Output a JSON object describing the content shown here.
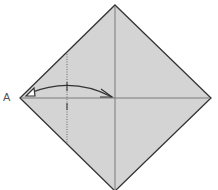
{
  "diagram": {
    "type": "origami-fold-step",
    "paper_color": "#d4d4d4",
    "edge_color": "#333333",
    "crease_color": "#7a7a7a",
    "arrow_color": "#333333",
    "vertex_label": "A",
    "instruction": "Fold corner A to the center point along the dotted valley-fold line",
    "shape": "square-rotated-45",
    "vertices": {
      "top": [
        115,
        5
      ],
      "right": [
        211,
        98
      ],
      "bottom": [
        115,
        191
      ],
      "left": [
        20,
        98
      ]
    },
    "creases": [
      "vertical-center",
      "horizontal-center"
    ],
    "fold_line": {
      "style": "dotted",
      "x": 67,
      "y_start": 54,
      "y_end": 143
    },
    "arrow": {
      "from": "A",
      "to": "center",
      "style": "curved-two-headed"
    }
  }
}
